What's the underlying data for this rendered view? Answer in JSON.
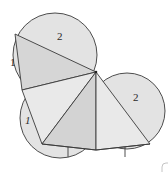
{
  "diagram": {
    "title": "",
    "colors": {
      "background": "#ffffff",
      "circle_fill": "#e2e2e2",
      "triangle_fill_light": "#e9e9e9",
      "triangle_fill_dark": "#d4d4d4",
      "stroke": "#3a3a3a"
    },
    "labels": {
      "top_circle": "2",
      "top_left_side": "1",
      "lower_left_side": "1",
      "right_circle": "2"
    },
    "shapes": {
      "circles": [
        {
          "name": "top-circle",
          "cx": 55,
          "cy": 55,
          "r": 42
        },
        {
          "name": "lower-left-circle",
          "cx": 60,
          "cy": 120,
          "r": 40
        },
        {
          "name": "right-circle",
          "cx": 128,
          "cy": 112,
          "r": 38
        }
      ],
      "hub_point": {
        "x": 96,
        "y": 72
      },
      "vertices": {
        "top_left": {
          "x": 15,
          "y": 34
        },
        "mid_left": {
          "x": 22,
          "y": 90
        },
        "bottom_left": {
          "x": 42,
          "y": 144
        },
        "bottom_mid": {
          "x": 96,
          "y": 150
        },
        "bottom_right": {
          "x": 150,
          "y": 144
        }
      }
    }
  }
}
